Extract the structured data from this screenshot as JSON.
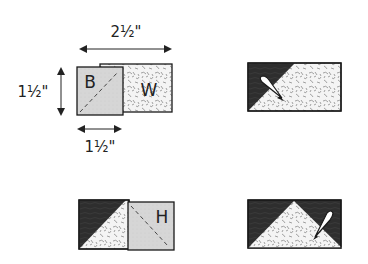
{
  "diagram": {
    "step1": {
      "width_label": "2½\"",
      "height_label": "1½\"",
      "square_width_label": "1½\"",
      "square_letter": "B",
      "rectangle_letter": "W"
    },
    "step2": {
      "description": "dark triangle pressed open on print rectangle"
    },
    "step3": {
      "square_letter": "H"
    },
    "step4": {
      "description": "flying geese unit pressed open"
    },
    "colors": {
      "dark_fabric": "#2e2e2e",
      "light_square": "#d4d4d4",
      "print_background": "#f4f4f4",
      "print_pattern": "#8a8a8a",
      "outline": "#1a1a1a"
    }
  }
}
